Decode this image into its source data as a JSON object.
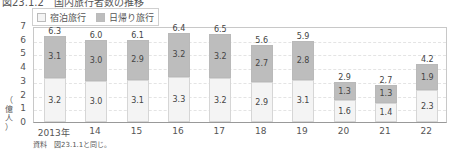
{
  "title": "図23.1.2　国内旅行者数の推移",
  "legend": [
    {
      "label": "宿泊旅行",
      "color": "#f4f4f4"
    },
    {
      "label": "日帰り旅行",
      "color": "#bdbdbd"
    }
  ],
  "y_axis": {
    "label": "（億人）",
    "ticks": [
      "0",
      "1",
      "2",
      "3",
      "4",
      "5",
      "6",
      "7"
    ]
  },
  "source": "資料　図23.1.1と同じ。",
  "chart_data": {
    "type": "bar",
    "stacked": true,
    "categories": [
      "2013年",
      "14",
      "15",
      "16",
      "17",
      "18",
      "19",
      "20",
      "21",
      "22"
    ],
    "series": [
      {
        "name": "宿泊旅行",
        "values": [
          3.2,
          3.0,
          3.1,
          3.3,
          3.2,
          2.9,
          3.1,
          1.6,
          1.4,
          2.3
        ]
      },
      {
        "name": "日帰り旅行",
        "values": [
          3.1,
          3.0,
          2.9,
          3.2,
          3.2,
          2.7,
          2.8,
          1.3,
          1.3,
          1.9
        ]
      }
    ],
    "totals": [
      "6.3",
      "6.0",
      "6.1",
      "6.4",
      "6.5",
      "5.6",
      "5.9",
      "2.9",
      "2.7",
      "4.2"
    ],
    "xlabel": "",
    "ylabel": "（億人）",
    "ylim": [
      0,
      7
    ],
    "grid": true,
    "legend_position": "top-left"
  }
}
